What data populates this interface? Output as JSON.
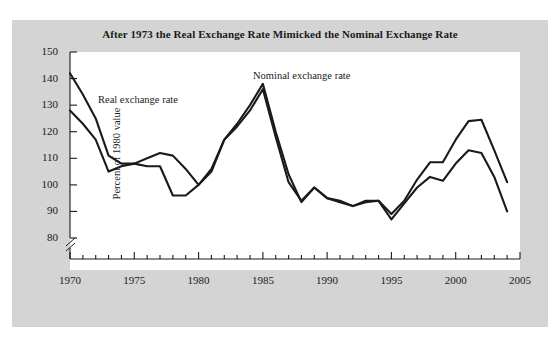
{
  "figure": {
    "title": "After 1973 the Real Exchange Rate Mimicked the Nominal Exchange Rate",
    "background_color": "#d4d4d4",
    "plot_background_color": "#ffffff",
    "line_color": "#1a1a1a"
  },
  "axes": {
    "ylabel": "Percent of 1980 value",
    "y_ticks": [
      "150",
      "140",
      "130",
      "120",
      "110",
      "100",
      "90",
      "80"
    ],
    "x_ticks": [
      "1970",
      "1975",
      "1980",
      "1985",
      "1990",
      "1995",
      "2000",
      "2005"
    ],
    "axis_break": "y-axis-break-glyph"
  },
  "annotations": {
    "real_label": "Real exchange rate",
    "nominal_label": "Nominal exchange rate"
  },
  "chart_data": {
    "type": "line",
    "title": "After 1973 the Real Exchange Rate Mimicked the Nominal Exchange Rate",
    "xlabel": "",
    "ylabel": "Percent of 1980 value",
    "xlim": [
      1970,
      2005
    ],
    "ylim": [
      80,
      150
    ],
    "grid": false,
    "legend": "inline-annotations",
    "x": [
      1970,
      1971,
      1972,
      1973,
      1974,
      1975,
      1976,
      1977,
      1978,
      1979,
      1980,
      1981,
      1982,
      1983,
      1984,
      1985,
      1986,
      1987,
      1988,
      1989,
      1990,
      1991,
      1992,
      1993,
      1994,
      1995,
      1996,
      1997,
      1998,
      1999,
      2000,
      2001,
      2002,
      2003,
      2004
    ],
    "series": [
      {
        "name": "Nominal exchange rate",
        "values": [
          142,
          134,
          125,
          111,
          108,
          108,
          110,
          112,
          111,
          106,
          100,
          105,
          117,
          123,
          130,
          138,
          120,
          104,
          93.5,
          99,
          95,
          94,
          92,
          94,
          94,
          89,
          94,
          102,
          108.5,
          108.5,
          117,
          124,
          124.5,
          113,
          101
        ]
      },
      {
        "name": "Real exchange rate",
        "values": [
          128,
          123,
          117,
          105,
          107,
          108,
          107,
          107,
          96,
          96,
          100,
          106,
          117,
          122,
          128,
          136,
          118,
          101,
          94,
          99,
          95,
          93.5,
          92,
          93.5,
          94,
          87,
          93,
          99,
          103,
          101.5,
          108,
          113,
          112,
          103,
          90
        ]
      }
    ]
  }
}
